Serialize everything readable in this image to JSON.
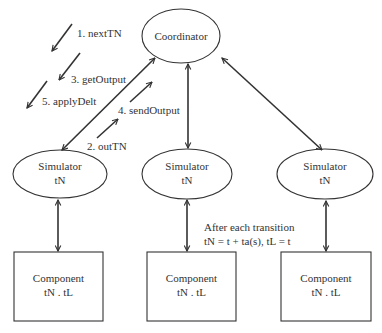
{
  "diagram": {
    "coordinator": {
      "label": "Coordinator"
    },
    "simulators": [
      {
        "label": "Simulator",
        "sublabel": "tN"
      },
      {
        "label": "Simulator",
        "sublabel": "tN"
      },
      {
        "label": "Simulator",
        "sublabel": "tN"
      }
    ],
    "components": [
      {
        "label": "Component",
        "sublabel": "tN . tL"
      },
      {
        "label": "Component",
        "sublabel": "tN . tL"
      },
      {
        "label": "Component",
        "sublabel": "tN . tL"
      }
    ],
    "messages": [
      {
        "label": "1. nextTN",
        "direction": "coordinator-to-simulator"
      },
      {
        "label": "2. outTN",
        "direction": "simulator-to-coordinator"
      },
      {
        "label": "3. getOutput",
        "direction": "coordinator-to-simulator"
      },
      {
        "label": "4. sendOutput",
        "direction": "simulator-to-coordinator"
      },
      {
        "label": "5. applyDelt",
        "direction": "coordinator-to-simulator"
      }
    ],
    "annotation": {
      "line1": "After each transition",
      "line2": "tN = t + ta(s), tL = t"
    },
    "colors": {
      "stroke": "#333333",
      "text": "#333333",
      "background": "#ffffff"
    }
  }
}
